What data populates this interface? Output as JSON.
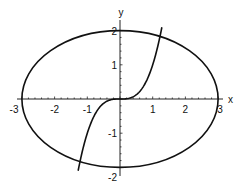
{
  "chart_data": {
    "type": "line",
    "title": "",
    "xlabel": "x",
    "ylabel": "y",
    "xlim": [
      -3,
      3
    ],
    "ylim": [
      -2,
      2
    ],
    "grid": false,
    "legend": null,
    "x_ticks": [
      -3,
      -2,
      -1,
      1,
      2,
      3
    ],
    "x_tick_labels": [
      "-3",
      "-2",
      "-1",
      "1",
      "2",
      "3"
    ],
    "y_ticks": [
      -2,
      -1,
      1,
      2
    ],
    "y_tick_labels": [
      "-2",
      "-1",
      "1",
      "2"
    ],
    "series": [
      {
        "name": "ellipse",
        "equation": "x^2/9 + y^2/4 = 1",
        "kind": "parametric",
        "a": 3,
        "b": 2,
        "samples": [
          [
            3,
            0
          ],
          [
            2.6,
            1
          ],
          [
            1.5,
            1.73
          ],
          [
            0,
            2
          ],
          [
            -1.5,
            1.73
          ],
          [
            -2.6,
            1
          ],
          [
            -3,
            0
          ],
          [
            -2.6,
            -1
          ],
          [
            -1.5,
            -1.73
          ],
          [
            0,
            -2
          ],
          [
            1.5,
            -1.73
          ],
          [
            2.6,
            -1
          ],
          [
            3,
            0
          ]
        ]
      },
      {
        "name": "cubic",
        "equation": "y = x^3",
        "kind": "function",
        "x_range": [
          -1.28,
          1.28
        ],
        "samples": [
          [
            -1.28,
            -2.1
          ],
          [
            -1,
            -1
          ],
          [
            -0.5,
            -0.125
          ],
          [
            0,
            0
          ],
          [
            0.5,
            0.125
          ],
          [
            1,
            1
          ],
          [
            1.28,
            2.1
          ]
        ]
      }
    ]
  },
  "axes": {
    "x_label": "x",
    "y_label": "y"
  }
}
